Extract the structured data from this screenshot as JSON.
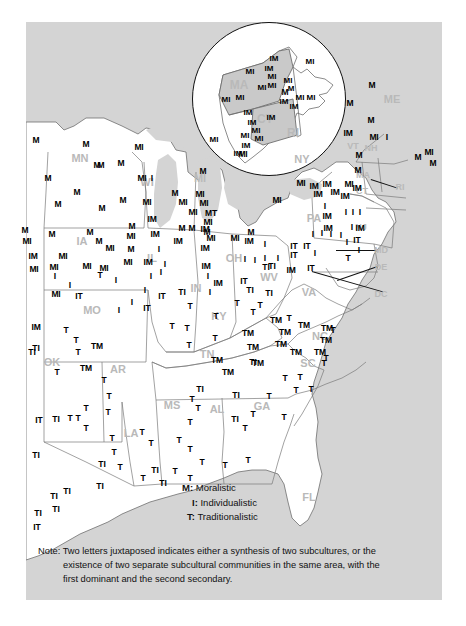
{
  "colors": {
    "water": "#d4d4d4",
    "land": "#ffffff",
    "border": "#6e6e6e",
    "state_label": "#b9b9b9",
    "marker": "#000000",
    "inset_fill": "#c9c9c9"
  },
  "legend": {
    "items": [
      {
        "key": "M:",
        "label": "Moralistic"
      },
      {
        "key": "I:",
        "label": "Individualistic"
      },
      {
        "key": "T:",
        "label": "Traditionalistic"
      }
    ]
  },
  "note": {
    "label": "Note:",
    "line1": "Two letters juxtaposed indicates either a synthesis of two subcultures, or the",
    "line2": "existence of two separate subcultural communities in the same area, with the",
    "line3": "first dominant and the second secondary."
  },
  "inset": {
    "name": "new-england-detail",
    "states": [
      {
        "abbr": "MA",
        "x": 46,
        "y": 62
      },
      {
        "abbr": "CT",
        "x": 72,
        "y": 96
      },
      {
        "abbr": "RI",
        "x": 100,
        "y": 110
      }
    ],
    "markers": [
      {
        "t": "IM",
        "x": 81,
        "y": 35
      },
      {
        "t": "IM",
        "x": 76,
        "y": 45
      },
      {
        "t": "MI",
        "x": 57,
        "y": 48
      },
      {
        "t": "MI",
        "x": 79,
        "y": 53
      },
      {
        "t": "MI",
        "x": 79,
        "y": 62
      },
      {
        "t": "MI",
        "x": 117,
        "y": 38
      },
      {
        "t": "MI",
        "x": 69,
        "y": 64
      },
      {
        "t": "MI",
        "x": 95,
        "y": 57
      },
      {
        "t": "M",
        "x": 98,
        "y": 65
      },
      {
        "t": "MI",
        "x": 107,
        "y": 74
      },
      {
        "t": "MI",
        "x": 118,
        "y": 74
      },
      {
        "t": "MI",
        "x": 33,
        "y": 76
      },
      {
        "t": "MI",
        "x": 47,
        "y": 74
      },
      {
        "t": "IM",
        "x": 91,
        "y": 78
      },
      {
        "t": "IM",
        "x": 101,
        "y": 83
      },
      {
        "t": "IM",
        "x": 55,
        "y": 89
      },
      {
        "t": "IM",
        "x": 78,
        "y": 94
      },
      {
        "t": "IM",
        "x": 59,
        "y": 99
      },
      {
        "t": "MI",
        "x": 63,
        "y": 107
      },
      {
        "t": "MI",
        "x": 52,
        "y": 112
      },
      {
        "t": "MI",
        "x": 66,
        "y": 115
      },
      {
        "t": "IM",
        "x": 53,
        "y": 122
      },
      {
        "t": "IM",
        "x": 45,
        "y": 130
      },
      {
        "t": "MI",
        "x": 21,
        "y": 116
      }
    ]
  },
  "states": [
    {
      "abbr": "MN",
      "x": 80,
      "y": 158
    },
    {
      "abbr": "WI",
      "x": 147,
      "y": 182
    },
    {
      "abbr": "MI",
      "x": 200,
      "y": 178
    },
    {
      "abbr": "IA",
      "x": 82,
      "y": 241
    },
    {
      "abbr": "IL",
      "x": 152,
      "y": 258
    },
    {
      "abbr": "IN",
      "x": 196,
      "y": 288
    },
    {
      "abbr": "OH",
      "x": 234,
      "y": 258
    },
    {
      "abbr": "MO",
      "x": 92,
      "y": 310
    },
    {
      "abbr": "KY",
      "x": 219,
      "y": 316
    },
    {
      "abbr": "WV",
      "x": 269,
      "y": 277
    },
    {
      "abbr": "VA",
      "x": 309,
      "y": 292
    },
    {
      "abbr": "TN",
      "x": 207,
      "y": 354
    },
    {
      "abbr": "NC",
      "x": 320,
      "y": 336
    },
    {
      "abbr": "SC",
      "x": 308,
      "y": 363
    },
    {
      "abbr": "GA",
      "x": 262,
      "y": 406
    },
    {
      "abbr": "AL",
      "x": 217,
      "y": 409
    },
    {
      "abbr": "MS",
      "x": 172,
      "y": 405
    },
    {
      "abbr": "LA",
      "x": 131,
      "y": 433
    },
    {
      "abbr": "AR",
      "x": 118,
      "y": 369
    },
    {
      "abbr": "OK",
      "x": 52,
      "y": 362
    },
    {
      "abbr": "FL",
      "x": 309,
      "y": 497
    },
    {
      "abbr": "PA",
      "x": 314,
      "y": 218
    },
    {
      "abbr": "NY",
      "x": 302,
      "y": 159
    },
    {
      "abbr": "ME",
      "x": 392,
      "y": 99
    },
    {
      "abbr": "VT",
      "x": 353,
      "y": 146
    },
    {
      "abbr": "NH",
      "x": 371,
      "y": 148
    },
    {
      "abbr": "MA",
      "x": 363,
      "y": 175
    },
    {
      "abbr": "CT",
      "x": 362,
      "y": 191
    },
    {
      "abbr": "RI",
      "x": 400,
      "y": 187
    },
    {
      "abbr": "NJ",
      "x": 361,
      "y": 227
    },
    {
      "abbr": "MD",
      "x": 381,
      "y": 250
    },
    {
      "abbr": "DE",
      "x": 381,
      "y": 267
    },
    {
      "abbr": "DC",
      "x": 381,
      "y": 294
    }
  ],
  "markers": [
    {
      "t": "M",
      "x": 36,
      "y": 140
    },
    {
      "t": "M",
      "x": 86,
      "y": 144
    },
    {
      "t": "M",
      "x": 97,
      "y": 165
    },
    {
      "t": "M",
      "x": 48,
      "y": 178
    },
    {
      "t": "M",
      "x": 77,
      "y": 192
    },
    {
      "t": "M",
      "x": 58,
      "y": 204
    },
    {
      "t": "M",
      "x": 101,
      "y": 165
    },
    {
      "t": "M",
      "x": 121,
      "y": 163
    },
    {
      "t": "MI",
      "x": 139,
      "y": 147
    },
    {
      "t": "MI",
      "x": 142,
      "y": 178
    },
    {
      "t": "MI",
      "x": 147,
      "y": 202
    },
    {
      "t": "I",
      "x": 152,
      "y": 178
    },
    {
      "t": "M",
      "x": 123,
      "y": 200
    },
    {
      "t": "M",
      "x": 102,
      "y": 208
    },
    {
      "t": "M",
      "x": 52,
      "y": 234
    },
    {
      "t": "M",
      "x": 25,
      "y": 230
    },
    {
      "t": "MI",
      "x": 27,
      "y": 241
    },
    {
      "t": "IM",
      "x": 33,
      "y": 256
    },
    {
      "t": "MI",
      "x": 34,
      "y": 269
    },
    {
      "t": "MI",
      "x": 54,
      "y": 267
    },
    {
      "t": "MI",
      "x": 63,
      "y": 256
    },
    {
      "t": "M",
      "x": 90,
      "y": 232
    },
    {
      "t": "M",
      "x": 99,
      "y": 241
    },
    {
      "t": "MI",
      "x": 110,
      "y": 248
    },
    {
      "t": "MI",
      "x": 104,
      "y": 268
    },
    {
      "t": "MI",
      "x": 87,
      "y": 266
    },
    {
      "t": "M",
      "x": 132,
      "y": 226
    },
    {
      "t": "MI",
      "x": 131,
      "y": 236
    },
    {
      "t": "IM",
      "x": 152,
      "y": 219
    },
    {
      "t": "IM",
      "x": 155,
      "y": 234
    },
    {
      "t": "M",
      "x": 131,
      "y": 249
    },
    {
      "t": "I",
      "x": 159,
      "y": 249
    },
    {
      "t": "MI",
      "x": 128,
      "y": 262
    },
    {
      "t": "IM",
      "x": 148,
      "y": 262
    },
    {
      "t": "I",
      "x": 165,
      "y": 264
    },
    {
      "t": "I",
      "x": 55,
      "y": 276
    },
    {
      "t": "I",
      "x": 70,
      "y": 285
    },
    {
      "t": "MI",
      "x": 56,
      "y": 294
    },
    {
      "t": "IT",
      "x": 79,
      "y": 296
    },
    {
      "t": "T",
      "x": 100,
      "y": 275
    },
    {
      "t": "I",
      "x": 116,
      "y": 280
    },
    {
      "t": "I",
      "x": 151,
      "y": 276
    },
    {
      "t": "I",
      "x": 161,
      "y": 272
    },
    {
      "t": "I",
      "x": 145,
      "y": 290
    },
    {
      "t": "IT",
      "x": 162,
      "y": 296
    },
    {
      "t": "I",
      "x": 132,
      "y": 302
    },
    {
      "t": "IT",
      "x": 147,
      "y": 308
    },
    {
      "t": "I",
      "x": 119,
      "y": 310
    },
    {
      "t": "IM",
      "x": 36,
      "y": 327
    },
    {
      "t": "T",
      "x": 66,
      "y": 330
    },
    {
      "t": "TI",
      "x": 36,
      "y": 348
    },
    {
      "t": "T",
      "x": 76,
      "y": 340
    },
    {
      "t": "T",
      "x": 78,
      "y": 352
    },
    {
      "t": "TM",
      "x": 97,
      "y": 346
    },
    {
      "t": "T",
      "x": 57,
      "y": 372
    },
    {
      "t": "TI",
      "x": 32,
      "y": 352
    },
    {
      "t": "TM",
      "x": 86,
      "y": 368
    },
    {
      "t": "T",
      "x": 104,
      "y": 380
    },
    {
      "t": "T",
      "x": 109,
      "y": 396
    },
    {
      "t": "T",
      "x": 86,
      "y": 408
    },
    {
      "t": "T",
      "x": 108,
      "y": 412
    },
    {
      "t": "IT",
      "x": 39,
      "y": 420
    },
    {
      "t": "TI",
      "x": 56,
      "y": 419
    },
    {
      "t": "T",
      "x": 70,
      "y": 418
    },
    {
      "t": "T",
      "x": 78,
      "y": 418
    },
    {
      "t": "T",
      "x": 86,
      "y": 428
    },
    {
      "t": "TI",
      "x": 36,
      "y": 455
    },
    {
      "t": "T",
      "x": 112,
      "y": 438
    },
    {
      "t": "T",
      "x": 142,
      "y": 432
    },
    {
      "t": "T",
      "x": 120,
      "y": 467
    },
    {
      "t": "T",
      "x": 143,
      "y": 478
    },
    {
      "t": "TI",
      "x": 100,
      "y": 486
    },
    {
      "t": "TI",
      "x": 67,
      "y": 491
    },
    {
      "t": "TI",
      "x": 54,
      "y": 496
    },
    {
      "t": "TI",
      "x": 56,
      "y": 509
    },
    {
      "t": "IT",
      "x": 37,
      "y": 527
    },
    {
      "t": "TI",
      "x": 38,
      "y": 513
    },
    {
      "t": "TI",
      "x": 102,
      "y": 464
    },
    {
      "t": "T",
      "x": 114,
      "y": 452
    },
    {
      "t": "T",
      "x": 151,
      "y": 443
    },
    {
      "t": "TI",
      "x": 155,
      "y": 470
    },
    {
      "t": "TI",
      "x": 163,
      "y": 483
    },
    {
      "t": "T",
      "x": 175,
      "y": 471
    },
    {
      "t": "T",
      "x": 190,
      "y": 478
    },
    {
      "t": "T",
      "x": 179,
      "y": 440
    },
    {
      "t": "T",
      "x": 190,
      "y": 449
    },
    {
      "t": "T",
      "x": 202,
      "y": 462
    },
    {
      "t": "T",
      "x": 225,
      "y": 465
    },
    {
      "t": "T",
      "x": 190,
      "y": 422
    },
    {
      "t": "T",
      "x": 198,
      "y": 408
    },
    {
      "t": "T",
      "x": 192,
      "y": 399
    },
    {
      "t": "TI",
      "x": 200,
      "y": 389
    },
    {
      "t": "TI",
      "x": 236,
      "y": 395
    },
    {
      "t": "T",
      "x": 269,
      "y": 396
    },
    {
      "t": "T",
      "x": 253,
      "y": 414
    },
    {
      "t": "T",
      "x": 245,
      "y": 428
    },
    {
      "t": "TI",
      "x": 235,
      "y": 419
    },
    {
      "t": "TM",
      "x": 228,
      "y": 372
    },
    {
      "t": "TM",
      "x": 258,
      "y": 363
    },
    {
      "t": "T",
      "x": 248,
      "y": 460
    },
    {
      "t": "T",
      "x": 284,
      "y": 417
    },
    {
      "t": "T",
      "x": 285,
      "y": 378
    },
    {
      "t": "T",
      "x": 300,
      "y": 377
    },
    {
      "t": "T",
      "x": 296,
      "y": 390
    },
    {
      "t": "T",
      "x": 311,
      "y": 389
    },
    {
      "t": "TM",
      "x": 296,
      "y": 352
    },
    {
      "t": "TM",
      "x": 281,
      "y": 344
    },
    {
      "t": "TM",
      "x": 253,
      "y": 347
    },
    {
      "t": "TM",
      "x": 248,
      "y": 333
    },
    {
      "t": "TM",
      "x": 285,
      "y": 332
    },
    {
      "t": "TM",
      "x": 320,
      "y": 352
    },
    {
      "t": "T",
      "x": 326,
      "y": 358
    },
    {
      "t": "T",
      "x": 324,
      "y": 363
    },
    {
      "t": "TM",
      "x": 327,
      "y": 328
    },
    {
      "t": "T",
      "x": 333,
      "y": 330
    },
    {
      "t": "TM",
      "x": 326,
      "y": 340
    },
    {
      "t": "TM",
      "x": 304,
      "y": 325
    },
    {
      "t": "T",
      "x": 289,
      "y": 318
    },
    {
      "t": "TM",
      "x": 276,
      "y": 320
    },
    {
      "t": "T",
      "x": 253,
      "y": 312
    },
    {
      "t": "T",
      "x": 216,
      "y": 316
    },
    {
      "t": "T",
      "x": 190,
      "y": 306
    },
    {
      "t": "T",
      "x": 172,
      "y": 326
    },
    {
      "t": "T",
      "x": 187,
      "y": 328
    },
    {
      "t": "T",
      "x": 189,
      "y": 345
    },
    {
      "t": "T",
      "x": 215,
      "y": 338
    },
    {
      "t": "TI",
      "x": 253,
      "y": 362
    },
    {
      "t": "TM",
      "x": 217,
      "y": 360
    },
    {
      "t": "T",
      "x": 260,
      "y": 305
    },
    {
      "t": "T",
      "x": 237,
      "y": 303
    },
    {
      "t": "TI",
      "x": 250,
      "y": 290
    },
    {
      "t": "TI",
      "x": 269,
      "y": 293
    },
    {
      "t": "TI",
      "x": 266,
      "y": 267
    },
    {
      "t": "IT",
      "x": 244,
      "y": 281
    },
    {
      "t": "IM",
      "x": 218,
      "y": 283
    },
    {
      "t": "I",
      "x": 210,
      "y": 292
    },
    {
      "t": "TI",
      "x": 182,
      "y": 292
    },
    {
      "t": "IM",
      "x": 206,
      "y": 266
    },
    {
      "t": "I",
      "x": 208,
      "y": 276
    },
    {
      "t": "MI",
      "x": 211,
      "y": 238
    },
    {
      "t": "MI",
      "x": 235,
      "y": 238
    },
    {
      "t": "IM",
      "x": 249,
      "y": 241
    },
    {
      "t": "M",
      "x": 251,
      "y": 232
    },
    {
      "t": "IM",
      "x": 205,
      "y": 248
    },
    {
      "t": "I",
      "x": 265,
      "y": 244
    },
    {
      "t": "I",
      "x": 245,
      "y": 259
    },
    {
      "t": "I",
      "x": 255,
      "y": 260
    },
    {
      "t": "I",
      "x": 265,
      "y": 258
    },
    {
      "t": "I",
      "x": 278,
      "y": 258
    },
    {
      "t": "IT",
      "x": 294,
      "y": 255
    },
    {
      "t": "TI",
      "x": 272,
      "y": 266
    },
    {
      "t": "IM",
      "x": 291,
      "y": 270
    },
    {
      "t": "M",
      "x": 203,
      "y": 171
    },
    {
      "t": "M",
      "x": 175,
      "y": 193
    },
    {
      "t": "MI",
      "x": 200,
      "y": 194
    },
    {
      "t": "MI",
      "x": 183,
      "y": 202
    },
    {
      "t": "MI",
      "x": 204,
      "y": 203
    },
    {
      "t": "MI",
      "x": 193,
      "y": 212
    },
    {
      "t": "MT",
      "x": 211,
      "y": 213
    },
    {
      "t": "MI",
      "x": 208,
      "y": 222
    },
    {
      "t": "M",
      "x": 182,
      "y": 228
    },
    {
      "t": "M",
      "x": 192,
      "y": 228
    },
    {
      "t": "IM",
      "x": 205,
      "y": 229
    },
    {
      "t": "M",
      "x": 207,
      "y": 232
    },
    {
      "t": "IM",
      "x": 178,
      "y": 241
    },
    {
      "t": "MI",
      "x": 243,
      "y": 154
    },
    {
      "t": "MI",
      "x": 277,
      "y": 200
    },
    {
      "t": "MI",
      "x": 301,
      "y": 183
    },
    {
      "t": "IM",
      "x": 314,
      "y": 186
    },
    {
      "t": "IM",
      "x": 327,
      "y": 184
    },
    {
      "t": "IM",
      "x": 318,
      "y": 194
    },
    {
      "t": "IM",
      "x": 335,
      "y": 192
    },
    {
      "t": "MI",
      "x": 349,
      "y": 184
    },
    {
      "t": "IM",
      "x": 345,
      "y": 196
    },
    {
      "t": "IM",
      "x": 357,
      "y": 188
    },
    {
      "t": "I",
      "x": 325,
      "y": 206
    },
    {
      "t": "IM",
      "x": 327,
      "y": 216
    },
    {
      "t": "IM",
      "x": 328,
      "y": 228
    },
    {
      "t": "I",
      "x": 346,
      "y": 212
    },
    {
      "t": "I",
      "x": 353,
      "y": 212
    },
    {
      "t": "I",
      "x": 360,
      "y": 212
    },
    {
      "t": "I",
      "x": 352,
      "y": 227
    },
    {
      "t": "IM",
      "x": 360,
      "y": 228
    },
    {
      "t": "I",
      "x": 313,
      "y": 234
    },
    {
      "t": "I",
      "x": 322,
      "y": 233
    },
    {
      "t": "I",
      "x": 331,
      "y": 234
    },
    {
      "t": "I",
      "x": 341,
      "y": 235
    },
    {
      "t": "I",
      "x": 347,
      "y": 242
    },
    {
      "t": "IT",
      "x": 357,
      "y": 240
    },
    {
      "t": "IT",
      "x": 294,
      "y": 246
    },
    {
      "t": "IT",
      "x": 307,
      "y": 246
    },
    {
      "t": "I",
      "x": 315,
      "y": 253
    },
    {
      "t": "T",
      "x": 348,
      "y": 258
    },
    {
      "t": "I",
      "x": 359,
      "y": 250
    },
    {
      "t": "IT",
      "x": 311,
      "y": 268
    },
    {
      "t": "M",
      "x": 285,
      "y": 92
    },
    {
      "t": "M",
      "x": 372,
      "y": 85
    },
    {
      "t": "M",
      "x": 371,
      "y": 120
    },
    {
      "t": "M",
      "x": 350,
      "y": 103
    },
    {
      "t": "IM",
      "x": 348,
      "y": 133
    },
    {
      "t": "MI",
      "x": 374,
      "y": 137
    },
    {
      "t": "I",
      "x": 387,
      "y": 137
    },
    {
      "t": "M",
      "x": 359,
      "y": 155
    },
    {
      "t": "M",
      "x": 358,
      "y": 170
    },
    {
      "t": "M",
      "x": 418,
      "y": 157
    },
    {
      "t": "MI",
      "x": 429,
      "y": 152
    },
    {
      "t": "M",
      "x": 433,
      "y": 163
    }
  ]
}
